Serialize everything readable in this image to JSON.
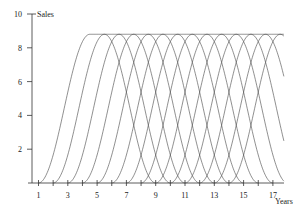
{
  "chart_data": {
    "type": "line",
    "title": "",
    "xlabel": "Years",
    "ylabel": "Sales",
    "x_ticks": [
      1,
      3,
      5,
      7,
      9,
      11,
      13,
      15,
      17
    ],
    "y_ticks": [
      2,
      4,
      6,
      8,
      10
    ],
    "xlim": [
      0.5,
      17.8
    ],
    "ylim": [
      0,
      10
    ],
    "grid": false,
    "legend": "none",
    "series_description": "Identical product life-cycle curves launched each year: rise over ~3.5 years to a plateau of ~8.8, stay ~1 year, then decline symmetrically",
    "peak_value": 8.8,
    "launch_years": [
      1,
      2,
      3,
      4,
      5,
      6,
      7,
      8,
      9,
      10,
      11,
      12,
      13,
      14
    ]
  }
}
